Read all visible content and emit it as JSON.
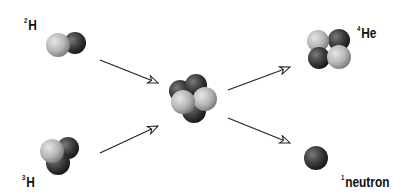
{
  "diagram": {
    "type": "nuclear-fusion-reaction",
    "reactants": [
      {
        "id": "deuterium",
        "mass_number": "2",
        "symbol": "H"
      },
      {
        "id": "tritium",
        "mass_number": "3",
        "symbol": "H"
      }
    ],
    "intermediate": {
      "id": "compound-nucleus"
    },
    "products": [
      {
        "id": "helium-4",
        "mass_number": "4",
        "symbol": "He"
      },
      {
        "id": "neutron",
        "mass_number": "1",
        "symbol": "neutron"
      }
    ],
    "colors": {
      "proton_light": "#bcbcbc",
      "neutron_dark": "#3a3a3a",
      "arrow": "#222222",
      "text": "#111111"
    }
  }
}
